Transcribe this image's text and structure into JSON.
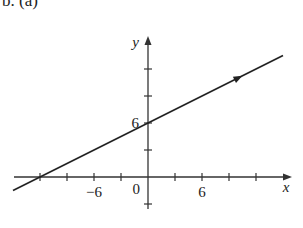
{
  "header": {
    "label": "b. (a)"
  },
  "chart_data": {
    "type": "line",
    "title": "",
    "xlabel": "x",
    "ylabel": "y",
    "xlim": [
      -15,
      16
    ],
    "ylim": [
      -3.5,
      14
    ],
    "x_ticks": [
      -12,
      -9,
      -6,
      -3,
      3,
      6,
      9,
      12
    ],
    "y_ticks": [
      -3,
      3,
      6,
      9,
      12
    ],
    "x_tick_labels": [
      {
        "value": -6,
        "text": "−6"
      },
      {
        "value": 6,
        "text": "6"
      }
    ],
    "y_tick_labels": [
      {
        "value": 6,
        "text": "6"
      }
    ],
    "origin_label": "0",
    "series": [
      {
        "name": "line",
        "equation": "y = x/2 + 6",
        "slope": 0.5,
        "intercept": 6,
        "x": [
          -15,
          15
        ],
        "y": [
          -1.5,
          13.5
        ],
        "direction_arrow_at_x": 10
      }
    ],
    "grid": false
  }
}
